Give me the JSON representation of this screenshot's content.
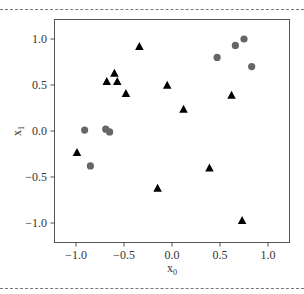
{
  "chart_data": {
    "type": "scatter",
    "title": "",
    "xlabel": "x",
    "xlabel_sub": "0",
    "ylabel": "x",
    "ylabel_sub": "1",
    "xlim": [
      -1.2,
      1.2
    ],
    "ylim": [
      -1.2,
      1.2
    ],
    "xticks": [
      -1.0,
      -0.5,
      0.0,
      0.5,
      1.0
    ],
    "xtick_labels": [
      "−1.0",
      "−0.5",
      "0.0",
      "0.5",
      "1.0"
    ],
    "yticks": [
      1.0,
      0.5,
      0.0,
      -0.5,
      -1.0
    ],
    "ytick_labels": [
      "1.0",
      "0.5",
      "0.0",
      "−0.5",
      "−1.0"
    ],
    "grid": false,
    "legend": null,
    "series": [
      {
        "name": "circles",
        "marker": "circle",
        "color": "#666666",
        "points": [
          [
            -0.91,
            0.01
          ],
          [
            -0.69,
            0.02
          ],
          [
            -0.65,
            -0.01
          ],
          [
            -0.85,
            -0.38
          ],
          [
            0.47,
            0.8
          ],
          [
            0.66,
            0.93
          ],
          [
            0.75,
            1.0
          ],
          [
            0.83,
            0.7
          ]
        ]
      },
      {
        "name": "triangles",
        "marker": "triangle",
        "color": "#000000",
        "points": [
          [
            -0.34,
            0.92
          ],
          [
            -0.6,
            0.63
          ],
          [
            -0.68,
            0.54
          ],
          [
            -0.57,
            0.54
          ],
          [
            -0.48,
            0.41
          ],
          [
            -0.05,
            0.5
          ],
          [
            0.12,
            0.24
          ],
          [
            0.62,
            0.39
          ],
          [
            -0.99,
            -0.23
          ],
          [
            0.39,
            -0.4
          ],
          [
            -0.15,
            -0.62
          ],
          [
            0.73,
            -0.97
          ]
        ]
      }
    ]
  }
}
